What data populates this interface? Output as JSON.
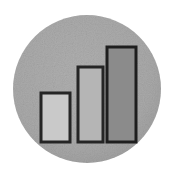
{
  "image": {
    "width": 174,
    "height": 174,
    "background_color": "#ffffff",
    "title": "Bar chart icon",
    "description": "Grayscale circular badge containing a three-bar ascending bar chart"
  },
  "badge": {
    "shape": "circle",
    "center_x": 87,
    "center_y": 89,
    "radius": 74,
    "fill_color": "#a9a9a9",
    "fill_color_edge": "#9d9d9d",
    "texture": "grainy"
  },
  "chart_data": {
    "type": "bar",
    "title": "",
    "subtitle": "",
    "xlabel": "",
    "ylabel": "",
    "categories": [
      "1",
      "2",
      "3"
    ],
    "values": [
      49,
      75,
      95
    ],
    "ylim": [
      0,
      100
    ],
    "grid": false,
    "legend": false,
    "legend_position": "none",
    "tick_labels_x": [],
    "tick_labels_y": [],
    "annotations": [],
    "series": [
      {
        "name": "bars",
        "values": [
          49,
          75,
          95
        ]
      }
    ],
    "bars": [
      {
        "label": "1",
        "value": 49,
        "x": 41,
        "y": 93,
        "width": 29,
        "height": 49,
        "fill": "#c9c9c9",
        "stroke": "#252525",
        "stroke_width": 3
      },
      {
        "label": "2",
        "value": 75,
        "x": 78,
        "y": 67,
        "width": 25,
        "height": 75,
        "fill": "#b5b5b5",
        "stroke": "#252525",
        "stroke_width": 3
      },
      {
        "label": "3",
        "value": 95,
        "x": 107,
        "y": 47,
        "width": 29,
        "height": 95,
        "fill": "#8b8b8b",
        "stroke": "#1e1e1e",
        "stroke_width": 3
      }
    ],
    "baseline_y": 142
  },
  "colors": {
    "background": "#ffffff",
    "badge": "#a9a9a9",
    "bar_light": "#c9c9c9",
    "bar_mid": "#b5b5b5",
    "bar_dark": "#8b8b8b",
    "outline": "#252525"
  }
}
